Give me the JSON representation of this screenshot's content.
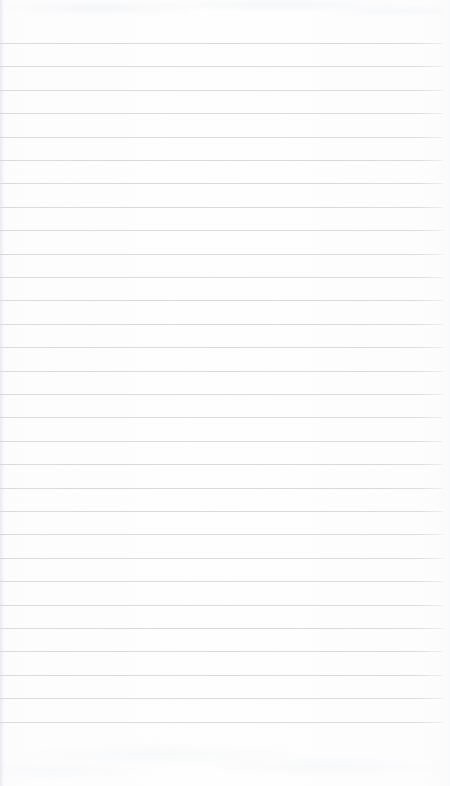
{
  "document": {
    "kind": "scanned-page",
    "description": "Blank ruled notepad page",
    "page_width": 450,
    "page_height": 786,
    "text_content": "",
    "handwriting": "none",
    "printed_text": "none"
  },
  "paper": {
    "background_color": "#fdfdfd",
    "edge_shadow_color": "#e4e7ea",
    "right_trim_color": "#f8f9fa"
  },
  "ruling": {
    "type": "horizontal-ruled",
    "line_color": "#d9dbde",
    "line_thickness_px": 1,
    "line_spacing_px": 23.4,
    "first_line_y_px": 43,
    "line_count": 30,
    "line_left_x_px": 0,
    "line_width_px": 443,
    "margin_rule": "none",
    "top_margin_px": 43,
    "bottom_margin_px": 58
  },
  "chart_data": {
    "type": "table",
    "title": "",
    "columns": [],
    "rows": []
  }
}
